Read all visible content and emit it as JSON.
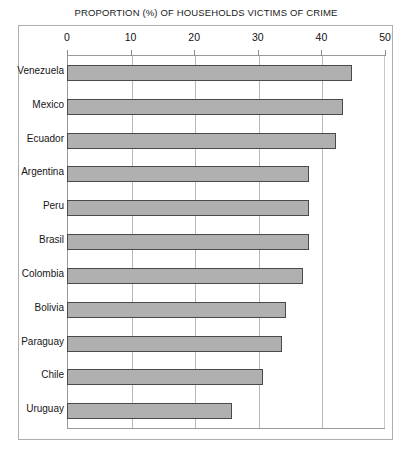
{
  "chart_data": {
    "type": "bar",
    "orientation": "horizontal",
    "title": "PROPORTION (%) OF HOUSEHOLDS  VICTIMS OF CRIME",
    "xlabel": "",
    "ylabel": "",
    "xlim": [
      0,
      50
    ],
    "grid": true,
    "legend": null,
    "xticks": [
      "0",
      "10",
      "20",
      "30",
      "40",
      "50"
    ],
    "xtick_values": [
      0,
      10,
      20,
      30,
      40,
      50
    ],
    "categories": [
      "Venezuela",
      "Mexico",
      "Ecuador",
      "Argentina",
      "Peru",
      "Brasil",
      "Colombia",
      "Bolivia",
      "Paraguay",
      "Chile",
      "Uruguay"
    ],
    "values": [
      44.8,
      43.4,
      42.3,
      38.1,
      38.1,
      38.1,
      37.1,
      34.4,
      33.8,
      30.8,
      25.9
    ],
    "bar_fill_color": "#b0b0b0",
    "bar_border_color": "#4a4a4a",
    "gridline_color": "#b8b8b8",
    "frame_color": "#aeaeae",
    "background_color": "#ffffff"
  }
}
